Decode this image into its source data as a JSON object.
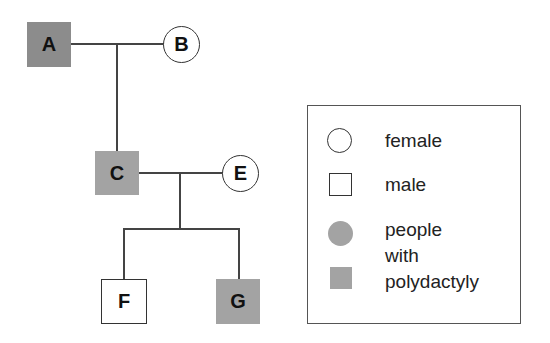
{
  "diagram": {
    "type": "pedigree",
    "individuals": [
      {
        "id": "A",
        "label": "A",
        "sex": "male",
        "affected": true
      },
      {
        "id": "B",
        "label": "B",
        "sex": "female",
        "affected": false
      },
      {
        "id": "C",
        "label": "C",
        "sex": "male",
        "affected": true
      },
      {
        "id": "E",
        "label": "E",
        "sex": "female",
        "affected": false
      },
      {
        "id": "F",
        "label": "F",
        "sex": "male",
        "affected": false
      },
      {
        "id": "G",
        "label": "G",
        "sex": "male",
        "affected": true
      }
    ],
    "matings": [
      {
        "partners": [
          "A",
          "B"
        ],
        "children": [
          "C"
        ]
      },
      {
        "partners": [
          "C",
          "E"
        ],
        "children": [
          "F",
          "G"
        ]
      }
    ]
  },
  "colors": {
    "affected_dark": "#8c8c8c",
    "affected_light": "#a3a3a3",
    "unaffected": "#ffffff",
    "line": "#444444"
  },
  "legend": {
    "female_label": "female",
    "male_label": "male",
    "affected_label_line1": "people",
    "affected_label_line2": "with",
    "affected_label_line3": "polydactyly"
  }
}
